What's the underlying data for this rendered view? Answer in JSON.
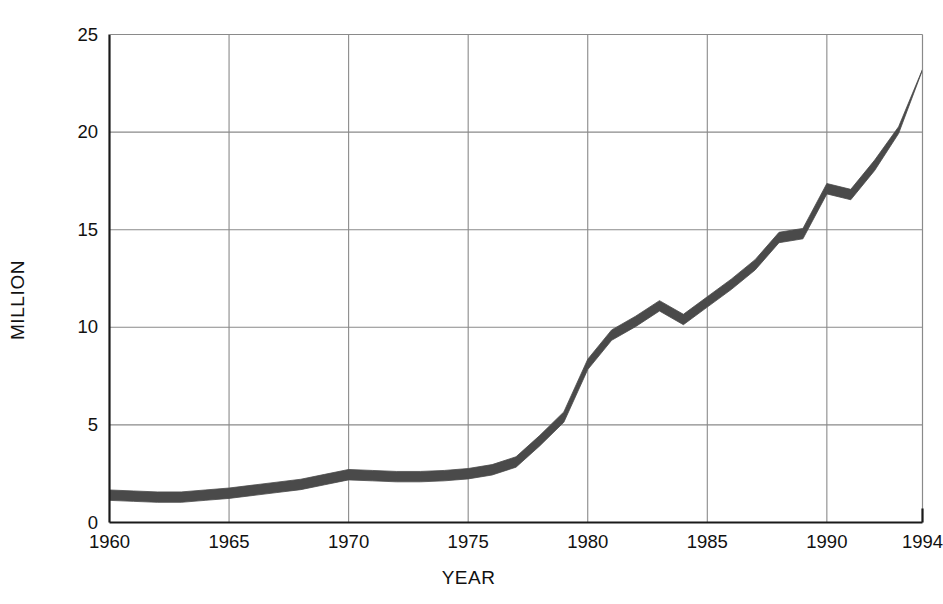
{
  "chart_data": {
    "type": "area",
    "title": "",
    "subtitle": "",
    "xlabel": "YEAR",
    "ylabel": "MILLION",
    "xlim": [
      1960,
      1994
    ],
    "ylim": [
      0,
      25
    ],
    "grid": true,
    "legend": null,
    "xticks": [
      1960,
      1965,
      1970,
      1975,
      1980,
      1985,
      1990,
      1994
    ],
    "xtick_labels": [
      "1960",
      "1965",
      "1970",
      "1975",
      "1980",
      "1985",
      "1990",
      "1994"
    ],
    "yticks": [
      0,
      5,
      10,
      15,
      20,
      25
    ],
    "ytick_labels": [
      "0",
      "5",
      "10",
      "15",
      "20",
      "25"
    ],
    "series": [
      {
        "name": "Value",
        "style": "thick-band",
        "color": "#4a4a4a",
        "x": [
          1960,
          1961,
          1962,
          1963,
          1964,
          1965,
          1966,
          1967,
          1968,
          1969,
          1970,
          1971,
          1972,
          1973,
          1974,
          1975,
          1976,
          1977,
          1978,
          1979,
          1980,
          1981,
          1982,
          1983,
          1984,
          1985,
          1986,
          1987,
          1988,
          1989,
          1990,
          1991,
          1992,
          1993,
          1994
        ],
        "values": [
          1.4,
          1.35,
          1.3,
          1.3,
          1.4,
          1.5,
          1.65,
          1.8,
          1.95,
          2.2,
          2.45,
          2.4,
          2.35,
          2.35,
          2.4,
          2.5,
          2.7,
          3.1,
          4.2,
          5.4,
          8.1,
          9.6,
          10.3,
          11.1,
          10.4,
          11.3,
          12.2,
          13.2,
          14.6,
          14.8,
          17.1,
          16.8,
          18.3,
          20.1,
          23.2
        ]
      }
    ],
    "band_labels": {
      "1960": "1.4",
      "1970": "2.45",
      "1977": "3.1",
      "1980": "8.1",
      "1983": "11.1",
      "1984": "10.4",
      "1990": "17.1",
      "1994": "23.2"
    },
    "axis_color": "#1a1a1a",
    "grid_color": "#8a8a8a",
    "background_color": "#ffffff"
  }
}
